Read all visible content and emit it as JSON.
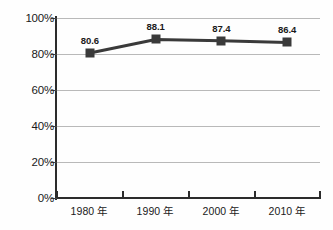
{
  "chart_data": {
    "type": "line",
    "title": "",
    "xlabel": "",
    "ylabel": "",
    "categories": [
      "1980 年",
      "1990 年",
      "2000 年",
      "2010 年"
    ],
    "values": [
      80.6,
      88.1,
      87.4,
      86.4
    ],
    "point_labels": [
      "80.6",
      "88.1",
      "87.4",
      "86.4"
    ],
    "ylim": [
      0,
      100
    ],
    "ytick_labels": [
      "0%",
      "20%",
      "40%",
      "60%",
      "80%",
      "100%"
    ],
    "ytick_values": [
      0,
      20,
      40,
      60,
      80,
      100
    ],
    "grid": true,
    "legend": false,
    "series": [
      {
        "name": "",
        "values": [
          80.6,
          88.1,
          87.4,
          86.4
        ],
        "marker": "square",
        "color": "#3a3a3a"
      }
    ],
    "colors": {
      "line": "#3a3a3a",
      "marker": "#3a3a3a",
      "grid": "#b9b9b9",
      "axis": "#2c2c2c",
      "text": "#1a1a1a",
      "background": "#fefefe"
    }
  }
}
